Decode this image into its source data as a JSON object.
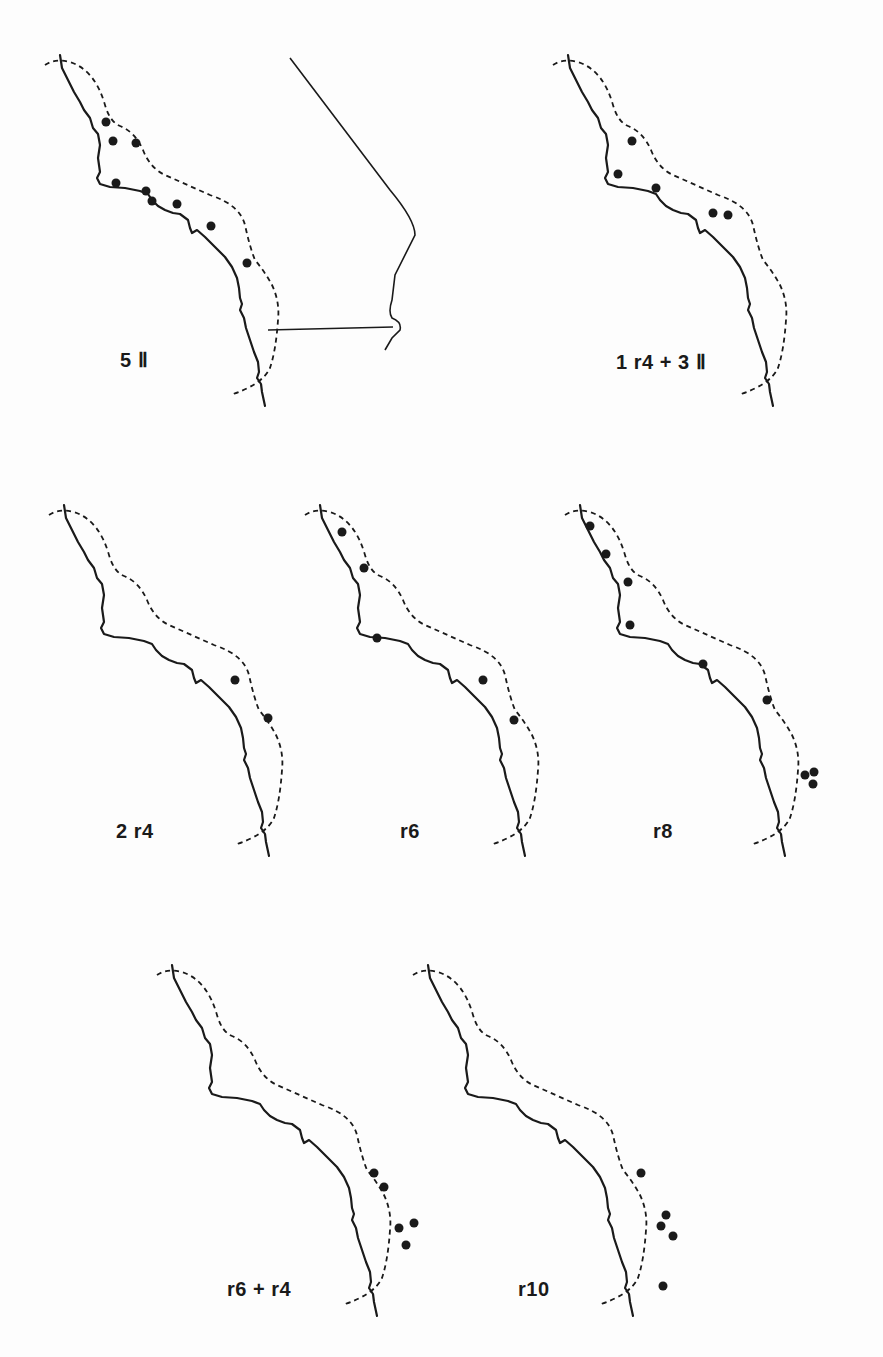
{
  "figure": {
    "panels": [
      {
        "id": "p1",
        "label": "5 Ⅱ",
        "dots": 10,
        "has_inland_border": true
      },
      {
        "id": "p2",
        "label": "1 r4 + 3 Ⅱ",
        "dots": 5,
        "has_inland_border": false
      },
      {
        "id": "p3",
        "label": "2 r4",
        "dots": 2,
        "has_inland_border": false
      },
      {
        "id": "p4",
        "label": "r6",
        "dots": 5,
        "has_inland_border": false
      },
      {
        "id": "p5",
        "label": "r8",
        "dots": 9,
        "has_inland_border": false
      },
      {
        "id": "p6",
        "label": "r6 + r4",
        "dots": 5,
        "has_inland_border": false
      },
      {
        "id": "p7",
        "label": "r10",
        "dots": 5,
        "has_inland_border": false
      }
    ]
  },
  "colors": {
    "ink": "#1a1a1a",
    "paper": "#fdfdfd"
  }
}
